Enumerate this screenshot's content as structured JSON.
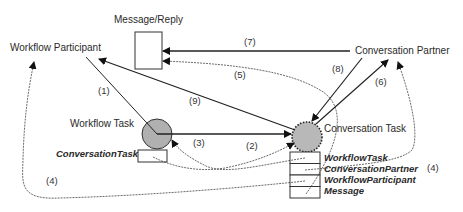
{
  "nodes": {
    "message_reply": {
      "label": "Message/Reply"
    },
    "workflow_participant": {
      "label": "Workflow Participant"
    },
    "conversation_partner": {
      "label": "Conversation Partner"
    },
    "workflow_task": {
      "label": "Workflow Task",
      "fill": "#b0b0b0"
    },
    "conversation_task": {
      "label": "Conversation Task",
      "fill": "#b8b8b8",
      "border_style": "dotted"
    },
    "conversation_task_ref": {
      "label": "ConversationTask"
    }
  },
  "attributes": {
    "conversation_task_fields": [
      {
        "label": "WorkflowTask"
      },
      {
        "label": "ConversationPartner"
      },
      {
        "label": "WorkflowParticipant"
      },
      {
        "label": "Message"
      }
    ]
  },
  "edges": [
    {
      "id": "1",
      "label": "(1)",
      "from": "Workflow Participant",
      "to": "Workflow Task",
      "style": "solid"
    },
    {
      "id": "2",
      "label": "(2)",
      "from": "ConversationTask",
      "to": "Conversation Task",
      "style": "dashed"
    },
    {
      "id": "3",
      "label": "(3)",
      "from": "WorkflowTask field",
      "to": "Workflow Task",
      "style": "dashed"
    },
    {
      "id": "4a",
      "label": "(4)",
      "from": "WorkflowParticipant field",
      "to": "Workflow Participant",
      "style": "dashed"
    },
    {
      "id": "4b",
      "label": "(4)",
      "from": "ConversationPartner field",
      "to": "Conversation Partner",
      "style": "dashed"
    },
    {
      "id": "5",
      "label": "(5)",
      "from": "Message field",
      "to": "Message/Reply",
      "style": "dashed"
    },
    {
      "id": "6",
      "label": "(6)",
      "from": "Conversation Task",
      "to": "Conversation Partner",
      "style": "solid"
    },
    {
      "id": "7",
      "label": "(7)",
      "from": "Conversation Partner",
      "to": "Message/Reply",
      "style": "solid"
    },
    {
      "id": "8",
      "label": "(8)",
      "from": "Conversation Partner",
      "to": "Conversation Task",
      "style": "solid"
    },
    {
      "id": "9",
      "label": "(9)",
      "from": "Conversation Task",
      "to": "Workflow Participant",
      "style": "solid"
    }
  ],
  "edge_labels": {
    "e1": "(1)",
    "e2": "(2)",
    "e3": "(3)",
    "e4_left": "(4)",
    "e4_right": "(4)",
    "e5": "(5)",
    "e6": "(6)",
    "e7": "(7)",
    "e8": "(8)",
    "e9": "(9)"
  }
}
